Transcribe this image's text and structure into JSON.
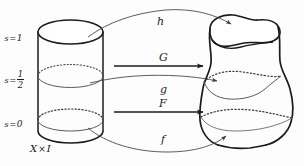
{
  "figure": {
    "background_color": "#fdfdfd",
    "ink_color": "#1b1b1b",
    "thin_color": "#555555"
  },
  "levels": [
    {
      "id": "s-top",
      "var": "s",
      "rel": "=",
      "value": "1",
      "kind": "integer",
      "y": 39
    },
    {
      "id": "s-middle",
      "var": "s",
      "rel": "=",
      "num": "1",
      "den": "2",
      "kind": "fraction",
      "y": 78
    },
    {
      "id": "s-bottom",
      "var": "s",
      "rel": "=",
      "value": "0",
      "kind": "integer",
      "y": 125
    }
  ],
  "domain": {
    "label_x": "X",
    "label_times": "×",
    "label_i": "I",
    "shape": "cylinder"
  },
  "codomain": {
    "shape": "deformed-tube"
  },
  "maps": [
    {
      "id": "h",
      "label": "h",
      "style": "curved",
      "x": 157,
      "y": 22
    },
    {
      "id": "G",
      "label": "G",
      "style": "straight",
      "x": 159,
      "y": 59
    },
    {
      "id": "g",
      "label": "g",
      "style": "curved",
      "x": 159,
      "y": 80
    },
    {
      "id": "F",
      "label": "F",
      "style": "straight",
      "x": 159,
      "y": 105
    },
    {
      "id": "f",
      "label": "f",
      "style": "curved",
      "x": 159,
      "y": 136
    }
  ]
}
